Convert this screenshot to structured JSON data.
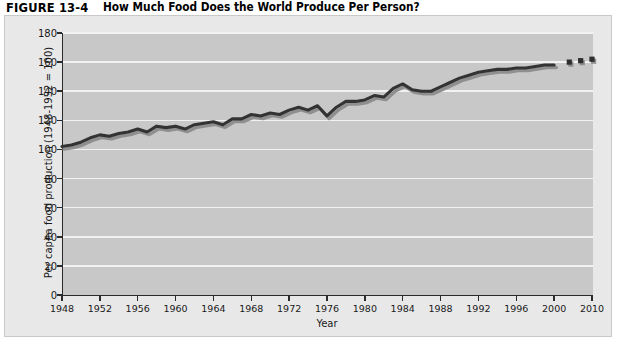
{
  "figure": {
    "number": "FIGURE 13-4",
    "title": "How Much Food Does the World Produce Per Person?"
  },
  "colors": {
    "page_background": "#ffffff",
    "panel_background": "#e8e8e8",
    "panel_border": "#c9c9c9",
    "plot_background": "#c8c8c8",
    "gridline": "#f2f2f2",
    "axis": "#2b2b2b",
    "line": "#333333",
    "line_shadow": "#8f8f8f",
    "marker": "#2e2e2e",
    "text": "#1a1a1a"
  },
  "chart_data": {
    "type": "line",
    "title": "How Much Food Does the World Produce Per Person?",
    "xlabel": "Year",
    "ylabel": "Per capita food production (1948-1952 = 100)",
    "xlim": [
      1948,
      2010
    ],
    "ylim": [
      0,
      180
    ],
    "ytick_step": 20,
    "yticks": [
      0,
      20,
      40,
      60,
      80,
      100,
      120,
      140,
      160,
      180
    ],
    "xticks": [
      1948,
      1952,
      1956,
      1960,
      1964,
      1968,
      1972,
      1976,
      1980,
      1984,
      1988,
      1992,
      1996,
      2000,
      2010
    ],
    "xtick_labels": [
      "1948",
      "1952",
      "1956",
      "1960",
      "1964",
      "1968",
      "1972",
      "1976",
      "1980",
      "1984",
      "1988",
      "1992",
      "1996",
      "2000",
      "2010"
    ],
    "grid": "horizontal",
    "legend": "none",
    "series": [
      {
        "name": "Per capita food production index",
        "style": "line-with-drop-shadow",
        "x": [
          1948,
          1949,
          1950,
          1951,
          1952,
          1953,
          1954,
          1955,
          1956,
          1957,
          1958,
          1959,
          1960,
          1961,
          1962,
          1963,
          1964,
          1965,
          1966,
          1967,
          1968,
          1969,
          1970,
          1971,
          1972,
          1973,
          1974,
          1975,
          1976,
          1977,
          1978,
          1979,
          1980,
          1981,
          1982,
          1983,
          1984,
          1985,
          1986,
          1987,
          1988,
          1989,
          1990,
          1991,
          1992,
          1993,
          1994,
          1995,
          1996,
          1997,
          1998,
          1999,
          2000
        ],
        "values": [
          102,
          103,
          105,
          108,
          110,
          109,
          111,
          112,
          114,
          112,
          116,
          115,
          116,
          114,
          117,
          118,
          119,
          117,
          121,
          121,
          124,
          123,
          125,
          124,
          127,
          129,
          127,
          130,
          123,
          129,
          133,
          133,
          134,
          137,
          136,
          142,
          145,
          141,
          140,
          140,
          143,
          146,
          149,
          151,
          153,
          154,
          155,
          155,
          156,
          156,
          157,
          158,
          158
        ]
      },
      {
        "name": "Projected points",
        "style": "square-markers",
        "x": [
          2004,
          2007,
          2010
        ],
        "values": [
          160,
          161,
          162
        ]
      }
    ]
  }
}
